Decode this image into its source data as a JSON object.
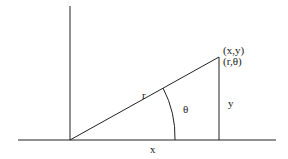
{
  "diagram": {
    "labels": {
      "radius": "r",
      "angle": "θ",
      "y_leg": "y",
      "x_leg": "x",
      "cartesian_point": "(x,y)",
      "polar_point": "(r,θ)"
    },
    "colors": {
      "line": "#222222",
      "background": "#ffffff"
    }
  }
}
